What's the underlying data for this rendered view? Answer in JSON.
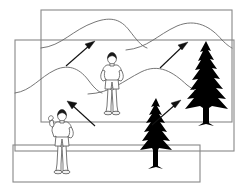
{
  "illustration": {
    "title": "Landscape photo montage with hikers, mountains and conifers",
    "background_color": "#ffffff",
    "line_color": "#666666",
    "frame_color": "#888888",
    "silhouette_color": "#000000",
    "arrow_color": "#111111",
    "figure_outline_color": "#555555",
    "hair_color": "#1a1a1a",
    "width": 240,
    "height": 192
  },
  "frames": [
    {
      "name": "upper-frame",
      "label": "Upper photo frame",
      "x": 41,
      "y": 10,
      "width": 191,
      "height": 112
    },
    {
      "name": "middle-frame",
      "label": "Middle photo frame",
      "x": 15,
      "y": 40,
      "width": 219,
      "height": 111
    },
    {
      "name": "lower-frame",
      "label": "Lower photo frame",
      "x": 13,
      "y": 145,
      "width": 187,
      "height": 37
    }
  ],
  "mountains": [
    {
      "name": "upper-ridge",
      "label": "Distant mountain ridge",
      "path": "M 41 48 C 62 46 72 30 95 22 C 112 16 120 20 128 29 C 136 38 140 46 146 48"
    },
    {
      "name": "upper-ridge-right",
      "label": "Distant mountain ridge right peak",
      "path": "M 127 48 C 148 47 158 34 178 26 C 196 19 210 27 222 40 C 227 45 230 47 232 48"
    },
    {
      "name": "lower-ridge-left",
      "label": "Near mountain ridge left hill",
      "path": "M 15 93 C 30 90 40 76 55 70 C 70 64 80 70 88 80 C 94 88 98 92 101 93"
    },
    {
      "name": "lower-ridge-right",
      "label": "Near mountain ridge right hill",
      "path": "M 88 93 C 110 92 122 80 140 72 C 158 64 172 72 186 84 C 194 90 200 93 205 93"
    }
  ],
  "arrows": [
    {
      "name": "arrow-upper-left",
      "label": "Direction arrow pointing up-right over left ridge",
      "x1": 66,
      "y1": 66,
      "x2": 93,
      "y2": 42,
      "direction": "up-right"
    },
    {
      "name": "arrow-upper-right",
      "label": "Direction arrow pointing up-right over right ridge",
      "x1": 160,
      "y1": 68,
      "x2": 186,
      "y2": 43,
      "direction": "up-right"
    },
    {
      "name": "arrow-lower-left",
      "label": "Direction arrow pointing up-left above near hiker",
      "x1": 95,
      "y1": 126,
      "x2": 69,
      "y2": 102,
      "direction": "up-left"
    },
    {
      "name": "arrow-lower-right",
      "label": "Direction arrow pointing up-right at small conifer",
      "x1": 152,
      "y1": 125,
      "x2": 180,
      "y2": 101,
      "direction": "up-right"
    }
  ],
  "trees": [
    {
      "name": "tree-large",
      "label": "Large conifer silhouette",
      "x": 206,
      "base_y": 123,
      "height": 82,
      "half_width": 22
    },
    {
      "name": "tree-small",
      "label": "Small conifer silhouette",
      "x": 156,
      "base_y": 166,
      "height": 68,
      "half_width": 18
    }
  ],
  "figures": [
    {
      "name": "figure-center",
      "label": "Hiker standing in centre of scene",
      "x": 112,
      "y": 61,
      "scale": 1.0,
      "pose": "hands-on-hips"
    },
    {
      "name": "figure-lower-left",
      "label": "Hiker with raised arm at lower left",
      "x": 62,
      "y": 118,
      "scale": 1.0,
      "pose": "raised-arm"
    }
  ]
}
